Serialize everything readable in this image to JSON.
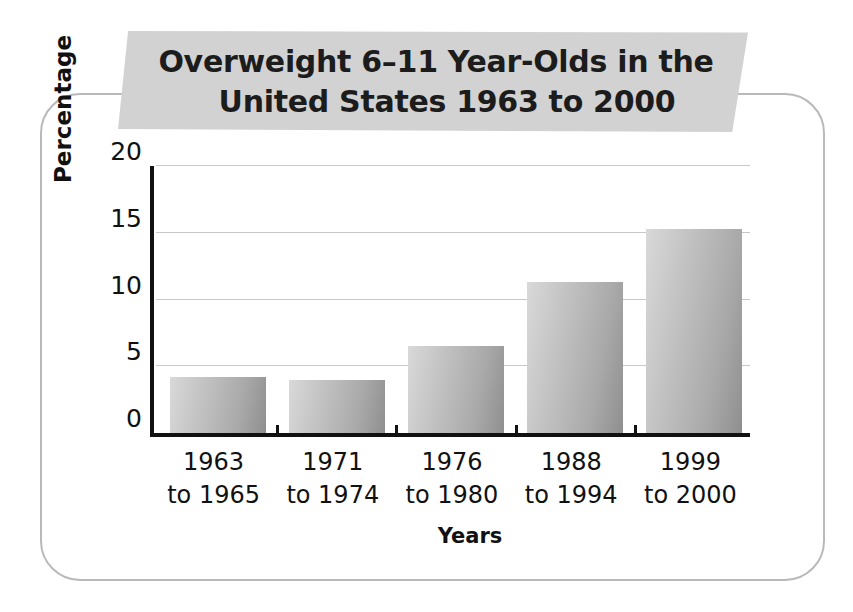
{
  "figure": {
    "title_line1": "Overweight 6–11 Year-Olds in the",
    "title_line2": "United States 1963 to 2000",
    "banner_color": "#d2d2d2",
    "frame_color": "#b9b9bb",
    "bar_color_light": "#d9d9d9",
    "bar_color_dark": "#8f8f8f",
    "axis_color": "#111111",
    "gridline_color": "#c8c8c8"
  },
  "chart_data": {
    "type": "bar",
    "title": "Overweight 6–11 Year-Olds in the United States 1963 to 2000",
    "xlabel": "Years",
    "ylabel": "Percentage",
    "categories": [
      "1963 to 1965",
      "1971 to 1974",
      "1976 to 1980",
      "1988 to 1994",
      "1999 to 2000"
    ],
    "category_lines": [
      {
        "top": "1963",
        "bottom": "to 1965"
      },
      {
        "top": "1971",
        "bottom": "to 1974"
      },
      {
        "top": "1976",
        "bottom": "to 1980"
      },
      {
        "top": "1988",
        "bottom": "to 1994"
      },
      {
        "top": "1999",
        "bottom": "to 2000"
      }
    ],
    "values": [
      4.2,
      4.0,
      6.5,
      11.3,
      15.3
    ],
    "ylim": [
      0,
      20
    ],
    "yticks": [
      0,
      5,
      10,
      15,
      20
    ],
    "ytick_labels": [
      "0",
      "5",
      "10",
      "15",
      "20"
    ],
    "grid": true,
    "legend": false
  }
}
